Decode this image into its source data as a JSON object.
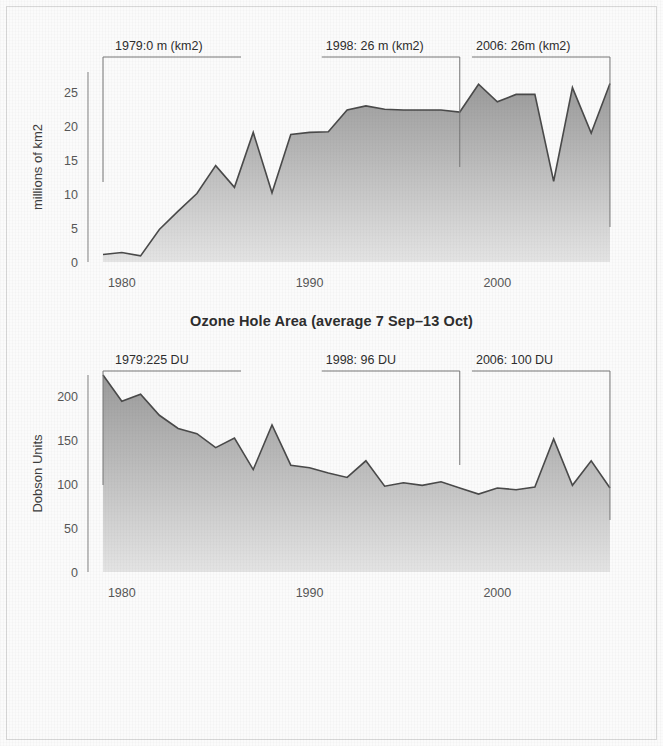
{
  "page": {
    "background_color": "#fbfbfb",
    "frame_color": "#d8d8d8",
    "area_fill_top": "#9a9a9a",
    "area_fill_bottom": "#e4e4e4",
    "line_color": "#4a4a4a"
  },
  "chart_data": [
    {
      "type": "area",
      "id": "ozone-hole-area",
      "title": "Ozone Hole Area (average 7 Sep–13 Oct)",
      "xlabel": "",
      "ylabel": "millions of km2",
      "xlim": [
        1978.2,
        2006.8
      ],
      "ylim": [
        0,
        28
      ],
      "ytick_values": [
        0,
        5,
        10,
        15,
        20,
        25
      ],
      "ytick_labels": [
        "0",
        "5",
        "10",
        "15",
        "20",
        "25"
      ],
      "xtick_values": [
        1980,
        1990,
        2000
      ],
      "xtick_labels": [
        "1980",
        "1990",
        "2000"
      ],
      "grid": false,
      "legend": "none",
      "x": [
        1979,
        1980,
        1981,
        1982,
        1983,
        1984,
        1985,
        1986,
        1987,
        1988,
        1989,
        1990,
        1991,
        1992,
        1993,
        1994,
        1995,
        1996,
        1997,
        1998,
        1999,
        2000,
        2001,
        2002,
        2003,
        2004,
        2005,
        2006
      ],
      "values": [
        1.1,
        1.4,
        0.9,
        4.8,
        7.5,
        10.1,
        14.2,
        11.0,
        19.1,
        10.2,
        18.8,
        19.1,
        19.2,
        22.4,
        23.0,
        22.5,
        22.4,
        22.4,
        22.4,
        22.1,
        26.2,
        23.6,
        24.7,
        24.7,
        11.9,
        25.7,
        19.0,
        26.3
      ],
      "annotations": [
        {
          "label": "1979:0 m (km2)",
          "x": 1979,
          "value": 0
        },
        {
          "label": "1998: 26 m (km2)",
          "x": 1998,
          "value": 26
        },
        {
          "label": "2006: 26m (km2)",
          "x": 2006,
          "value": 26
        }
      ]
    },
    {
      "type": "area",
      "id": "minimum-ozone",
      "title": "Minimum Ozone (average 21 Sep–16 Oct)",
      "xlabel": "",
      "ylabel": "Dobson Units",
      "xlim": [
        1978.2,
        2006.8
      ],
      "ylim": [
        0,
        225
      ],
      "ytick_values": [
        0,
        50,
        100,
        150,
        200
      ],
      "ytick_labels": [
        "0",
        "50",
        "100",
        "150",
        "200"
      ],
      "xtick_values": [
        1980,
        1990,
        2000
      ],
      "xtick_labels": [
        "1980",
        "1990",
        "2000"
      ],
      "grid": false,
      "legend": "none",
      "x": [
        1979,
        1980,
        1981,
        1982,
        1983,
        1984,
        1985,
        1986,
        1987,
        1988,
        1989,
        1990,
        1991,
        1992,
        1993,
        1994,
        1995,
        1996,
        1997,
        1998,
        1999,
        2000,
        2001,
        2002,
        2003,
        2004,
        2005,
        2006
      ],
      "values": [
        225,
        195,
        203,
        179,
        164,
        158,
        142,
        153,
        117,
        168,
        122,
        119,
        113,
        108,
        127,
        98,
        102,
        99,
        103,
        96,
        89,
        96,
        94,
        97,
        152,
        99,
        127,
        96
      ],
      "annotations": [
        {
          "label": "1979:225 DU",
          "x": 1979,
          "value": 225
        },
        {
          "label": "1998: 96 DU",
          "x": 1998,
          "value": 96
        },
        {
          "label": "2006: 100 DU",
          "x": 2006,
          "value": 100
        }
      ]
    }
  ]
}
